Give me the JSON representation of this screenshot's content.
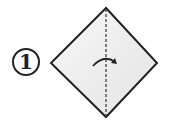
{
  "diagram": {
    "type": "origami-step",
    "step_number": "1",
    "shape": "square-diamond",
    "fold_line": "vertical-valley-fold",
    "arrow": "fold-left-to-right",
    "colors": {
      "stroke": "#222222",
      "fill": "#ededed",
      "background": "#ffffff"
    }
  }
}
